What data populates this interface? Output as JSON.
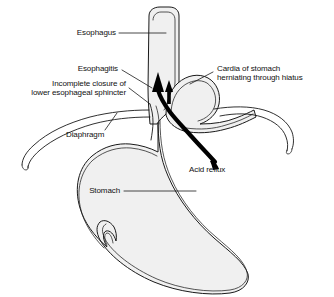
{
  "figure": {
    "background_color": "#ffffff",
    "organ_fill_color": "#f0f0f0",
    "outline_color": "#1a1a1a",
    "arrow_color": "#000000",
    "width": 334,
    "height": 297
  },
  "labels": {
    "esophagus": "Esophagus",
    "esophagitis": "Esophagitis",
    "sphincter_line1": "Incomplete closure of",
    "sphincter_line2": "lower esophageal sphincter",
    "diaphragm": "Diaphragm",
    "cardia_line1": "Cardia of stomach",
    "cardia_line2": "herniating through hiatus",
    "acid_reflux": "Acid reflux",
    "stomach": "Stomach"
  },
  "structures": [
    {
      "name": "esophagus",
      "label": "Esophagus"
    },
    {
      "name": "esophagitis",
      "label": "Esophagitis"
    },
    {
      "name": "lower-esophageal-sphincter",
      "label": "Incomplete closure of lower esophageal sphincter"
    },
    {
      "name": "diaphragm",
      "label": "Diaphragm"
    },
    {
      "name": "hiatal-hernia",
      "label": "Cardia of stomach herniating through hiatus"
    },
    {
      "name": "acid-reflux",
      "label": "Acid reflux"
    },
    {
      "name": "stomach",
      "label": "Stomach"
    }
  ]
}
